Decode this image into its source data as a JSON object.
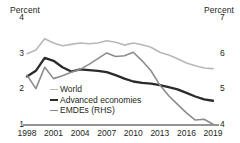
{
  "chart_data": {
    "type": "line",
    "title": "",
    "xlabel": "",
    "ylabel": "Percent",
    "y2label": "Percent",
    "grid": false,
    "legend_position": "inside-bottom-left",
    "x": [
      1998,
      1999,
      2000,
      2001,
      2002,
      2003,
      2004,
      2005,
      2006,
      2007,
      2008,
      2009,
      2010,
      2011,
      2012,
      2013,
      2014,
      2015,
      2016,
      2017,
      2018,
      2019
    ],
    "xticks": [
      "1998",
      "2001",
      "2004",
      "2007",
      "2010",
      "2013",
      "2016",
      "2019"
    ],
    "xtick_values": [
      1998,
      2001,
      2004,
      2007,
      2010,
      2013,
      2016,
      2019
    ],
    "ylim": [
      1,
      4
    ],
    "yticks": [
      "1",
      "2",
      "3",
      "4"
    ],
    "ytick_values": [
      1,
      2,
      3,
      4
    ],
    "y2lim": [
      4,
      7
    ],
    "y2ticks": [
      "4",
      "5",
      "6",
      "7"
    ],
    "y2tick_values": [
      4,
      5,
      6,
      7
    ],
    "series": [
      {
        "name": "World",
        "axis": "left",
        "color": "#b8b8b8",
        "width": 1.6,
        "values": [
          3.0,
          3.1,
          3.42,
          3.3,
          3.22,
          3.26,
          3.3,
          3.28,
          3.3,
          3.36,
          3.32,
          3.24,
          3.3,
          3.25,
          3.18,
          3.04,
          2.96,
          2.86,
          2.74,
          2.66,
          2.6,
          2.58
        ]
      },
      {
        "name": "Advanced economies",
        "axis": "left",
        "color": "#2b2b2b",
        "width": 2.3,
        "values": [
          2.36,
          2.52,
          2.88,
          2.8,
          2.62,
          2.5,
          2.56,
          2.54,
          2.52,
          2.48,
          2.4,
          2.3,
          2.22,
          2.18,
          2.16,
          2.12,
          2.06,
          2.0,
          1.9,
          1.8,
          1.72,
          1.68
        ]
      },
      {
        "name": "EMDEs (RHS)",
        "axis": "right",
        "color": "#8c8c8c",
        "width": 1.6,
        "values": [
          5.4,
          5.02,
          5.62,
          5.3,
          5.38,
          5.48,
          5.56,
          5.7,
          5.86,
          6.02,
          5.92,
          5.94,
          6.04,
          5.8,
          5.52,
          5.12,
          4.82,
          4.58,
          4.34,
          4.14,
          4.16,
          4.02
        ]
      }
    ]
  },
  "axes": {
    "left_title": "Percent",
    "right_title": "Percent"
  },
  "legend": {
    "items": [
      {
        "label": "World",
        "color": "#b8b8b8"
      },
      {
        "label": "Advanced economies",
        "color": "#2b2b2b"
      },
      {
        "label": "EMDEs (RHS)",
        "color": "#8c8c8c"
      }
    ]
  }
}
